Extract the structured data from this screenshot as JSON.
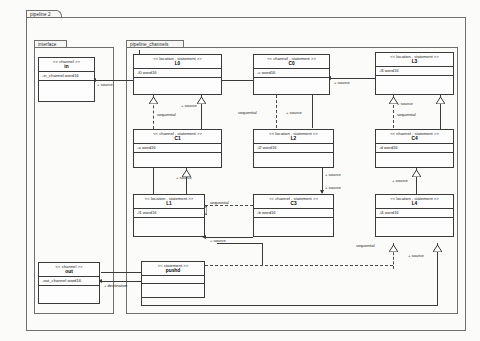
{
  "diagram": {
    "type": "uml-class-diagram",
    "outer_package": "pipeline 2",
    "packages": [
      {
        "id": "interface",
        "label": "interface"
      },
      {
        "id": "pipeline_channels",
        "label": "pipeline_channels"
      }
    ],
    "colors": {
      "line": "#3a3a3a",
      "box_fill": "#fdfdfd",
      "package_line": "#6f6f6f",
      "page_bg": "#fbfbfa"
    }
  },
  "classes": [
    {
      "id": "in",
      "stereotype": "<<  channel  >>",
      "name": "in",
      "attribute": "-in_channel  word16",
      "package": "interface"
    },
    {
      "id": "out",
      "stereotype": "<<  channel  >>",
      "name": "out",
      "attribute": "-out_channel  word16",
      "package": "interface"
    },
    {
      "id": "L0",
      "stereotype": "<<  location , statement  >>",
      "name": "L0",
      "attribute": "-l0 word16",
      "package": "pipeline_channels"
    },
    {
      "id": "C0",
      "stereotype": "<<  channel , statement  >>",
      "name": "C0",
      "attribute": "-c word16",
      "package": "pipeline_channels"
    },
    {
      "id": "L3",
      "stereotype": "<<  location , statement  >>",
      "name": "L3",
      "attribute": "-l3 word16",
      "package": "pipeline_channels"
    },
    {
      "id": "C1",
      "stereotype": "<<  channel , statement  >>",
      "name": "C1",
      "attribute": "-a word16",
      "package": "pipeline_channels"
    },
    {
      "id": "L2",
      "stereotype": "<<  location , statement  >>",
      "name": "L2",
      "attribute": "-l2 word16",
      "package": "pipeline_channels"
    },
    {
      "id": "C4",
      "stereotype": "<<  channel , statement  >>",
      "name": "C4",
      "attribute": "-d word16",
      "package": "pipeline_channels"
    },
    {
      "id": "L1",
      "stereotype": "<<  location , statement  >>",
      "name": "L1",
      "attribute": "-l1 word16",
      "package": "pipeline_channels"
    },
    {
      "id": "C3",
      "stereotype": "<<  channel , statement  >>",
      "name": "C3",
      "attribute": "-b word16",
      "package": "pipeline_channels"
    },
    {
      "id": "L4",
      "stereotype": "<<  location , statement  >>",
      "name": "L4",
      "attribute": "-l4 word16",
      "package": "pipeline_channels"
    },
    {
      "id": "pushd",
      "stereotype": "<<  statement  >>",
      "name": "pushd",
      "attribute": "",
      "package": "pipeline_channels"
    }
  ],
  "edge_labels": {
    "source_in": "+ source",
    "source_L0_left": "+ source",
    "source_L0_right": "+ source",
    "sequential_L0_C1": "sequential",
    "source_C0": "+ source",
    "sequential_C0_L2": "sequential",
    "source_L2": "+ source",
    "source_L3": "+ source",
    "sequential_L3_C4": "sequential",
    "source_C4": "+ source",
    "source_C1": "+ source",
    "source_L1_a": "+ source",
    "sequential_L1_C3": "sequential",
    "source_C3": "+ source",
    "sequential_L4": "sequential",
    "source_L4": "+ source",
    "destination_out": "+ destination"
  }
}
